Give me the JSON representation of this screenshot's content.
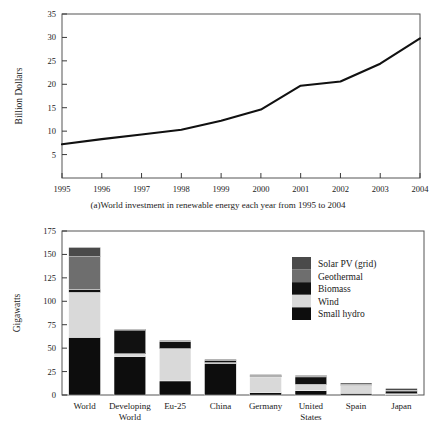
{
  "figure": {
    "panel_a_caption": "(a)World investment in renewable energy each year from 1995 to 2004"
  },
  "chart_data": [
    {
      "type": "line",
      "panel": "a",
      "title": "",
      "caption": "(a)World investment in renewable energy each year from 1995 to 2004",
      "xlabel": "",
      "ylabel": "Billion Dollars",
      "x": [
        "1995",
        "1996",
        "1997",
        "1998",
        "1999",
        "2000",
        "2001",
        "2002",
        "2003",
        "2004"
      ],
      "values": [
        7.2,
        8.3,
        9.3,
        10.3,
        12.2,
        14.6,
        19.7,
        20.6,
        24.4,
        29.8
      ],
      "xticklabels": [
        "1995",
        "1996",
        "1997",
        "1998",
        "1999",
        "2000",
        "2001",
        "2002",
        "2003",
        "2004"
      ],
      "yticks": [
        5,
        10,
        15,
        20,
        25,
        30,
        35
      ],
      "yticklabels": [
        "5",
        "10",
        "15",
        "20",
        "25",
        "30",
        "35"
      ],
      "ylim": [
        0,
        35
      ],
      "grid": false,
      "line_color": "#111111",
      "legend": "none"
    },
    {
      "type": "bar",
      "panel": "b",
      "subtype": "stacked",
      "title": "",
      "xlabel": "",
      "ylabel": "Gigawatts",
      "categories": [
        "World",
        "Developing World",
        "Eu-25",
        "China",
        "Germany",
        "United States",
        "Spain",
        "Japan"
      ],
      "category_lines": [
        [
          "World"
        ],
        [
          "Developing",
          "World"
        ],
        [
          "Eu-25"
        ],
        [
          "China"
        ],
        [
          "Germany"
        ],
        [
          "United",
          "States"
        ],
        [
          "Spain"
        ],
        [
          "Japan"
        ]
      ],
      "series": [
        {
          "name": "Small hydro",
          "color": "#0d0d0d",
          "values": [
            61.5,
            41.0,
            15.0,
            34.0,
            2.5,
            4.5,
            1.8,
            0.4
          ]
        },
        {
          "name": "Wind",
          "color": "#d9d9d9",
          "values": [
            48.0,
            3.0,
            34.5,
            0.5,
            16.8,
            6.8,
            8.5,
            0.9
          ]
        },
        {
          "name": "Biomass",
          "color": "#111111",
          "values": [
            3.0,
            25.5,
            8.0,
            3.0,
            1.0,
            8.0,
            0.8,
            3.2
          ]
        },
        {
          "name": "Geothermal",
          "color": "#6e6e6e",
          "values": [
            35.0,
            0.5,
            0.5,
            0.2,
            0.3,
            1.2,
            0.2,
            0.5
          ]
        },
        {
          "name": "Solar PV (grid)",
          "color": "#4a4a4a",
          "values": [
            10.0,
            0.4,
            0.3,
            0.3,
            1.2,
            0.5,
            1.5,
            2.0
          ]
        }
      ],
      "totals": [
        157.5,
        70.4,
        58.3,
        38.0,
        21.8,
        21.0,
        12.8,
        7.0
      ],
      "yticks": [
        0,
        25,
        50,
        75,
        100,
        125,
        150,
        175
      ],
      "yticklabels": [
        "0",
        "25",
        "50",
        "75",
        "100",
        "125",
        "150",
        "175"
      ],
      "ylim": [
        0,
        175
      ],
      "grid": false,
      "legend_position": "upper right",
      "legend_entries": [
        {
          "label": "Solar PV (grid)",
          "color": "#4a4a4a"
        },
        {
          "label": "Geothermal",
          "color": "#6e6e6e"
        },
        {
          "label": "Biomass",
          "color": "#111111"
        },
        {
          "label": "Wind",
          "color": "#d9d9d9"
        },
        {
          "label": "Small hydro",
          "color": "#0d0d0d"
        }
      ]
    }
  ]
}
